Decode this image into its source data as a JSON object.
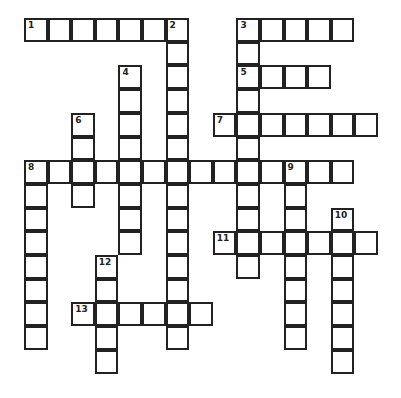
{
  "puzzle": {
    "type": "crossword",
    "cell_size": 23.6,
    "origin": [
      25,
      19
    ],
    "entries": [
      {
        "number": "1",
        "dir": "across",
        "row": 0,
        "col": 0,
        "length": 7
      },
      {
        "number": "2",
        "dir": "down",
        "row": 0,
        "col": 6,
        "length": 14
      },
      {
        "number": "3",
        "dir": "across",
        "row": 0,
        "col": 9,
        "length": 5
      },
      {
        "number": "3",
        "dir": "down",
        "row": 0,
        "col": 9,
        "length": 11
      },
      {
        "number": "4",
        "dir": "down",
        "row": 2,
        "col": 4,
        "length": 8
      },
      {
        "number": "5",
        "dir": "across",
        "row": 2,
        "col": 9,
        "length": 4
      },
      {
        "number": "6",
        "dir": "down",
        "row": 4,
        "col": 2,
        "length": 4
      },
      {
        "number": "7",
        "dir": "across",
        "row": 4,
        "col": 8,
        "length": 7
      },
      {
        "number": "8",
        "dir": "across",
        "row": 6,
        "col": 0,
        "length": 14
      },
      {
        "number": "8",
        "dir": "down",
        "row": 6,
        "col": 0,
        "length": 8
      },
      {
        "number": "9",
        "dir": "down",
        "row": 6,
        "col": 11,
        "length": 8
      },
      {
        "number": "10",
        "dir": "down",
        "row": 8,
        "col": 13,
        "length": 7
      },
      {
        "number": "11",
        "dir": "across",
        "row": 9,
        "col": 8,
        "length": 7
      },
      {
        "number": "12",
        "dir": "down",
        "row": 10,
        "col": 3,
        "length": 5
      },
      {
        "number": "13",
        "dir": "across",
        "row": 12,
        "col": 2,
        "length": 6
      }
    ]
  }
}
